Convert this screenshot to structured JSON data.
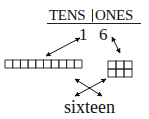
{
  "header": {
    "tens_label": "TENS",
    "ones_label": "ONES"
  },
  "digits": {
    "tens": "1",
    "ones": "6"
  },
  "blocks": {
    "ten_rod_units": 10,
    "ones_units": 6,
    "ones_columns": 3
  },
  "word": "sixteen"
}
